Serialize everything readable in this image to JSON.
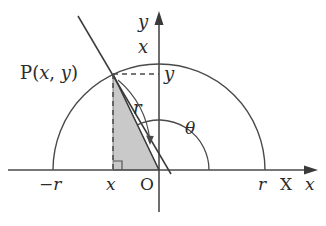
{
  "figure": {
    "colors": {
      "stroke": "#3a3a3a",
      "axis": "#4a4a4a",
      "shade_fill": "#c9c9c9",
      "shade_stroke": "#555555",
      "background": "#ffffff",
      "text": "#2b2b2b"
    },
    "geometry": {
      "origin_px": [
        159,
        170
      ],
      "radius_px": 106,
      "point_p_px": [
        113,
        74
      ],
      "foot_px": [
        113,
        170
      ],
      "angle_arc_radius_px": 50,
      "semicircle_left_px": [
        53,
        170
      ],
      "semicircle_right_px": [
        265,
        170
      ],
      "steep_line_start_px": [
        78,
        16
      ],
      "steep_line_end_px": [
        172,
        176
      ],
      "y_axis_top_px": [
        159,
        13
      ],
      "y_axis_bottom_px": [
        159,
        212
      ],
      "x_axis_left_px": [
        8,
        170
      ],
      "x_axis_right_px": [
        318,
        170
      ]
    },
    "labels": {
      "point_p": {
        "name": "P",
        "open": "(",
        "x": "x",
        "comma": ",",
        "y": "y",
        "close": ")"
      },
      "y_axis": "y",
      "y_axis_x_component": "x",
      "p_y_projection": "y",
      "radius": "r",
      "angle": "θ",
      "x_neg_r": "−r",
      "x_foot": "x",
      "origin": "O",
      "x_pos_r": "r",
      "x_axis_big": "X",
      "x_axis_small": "x"
    }
  }
}
